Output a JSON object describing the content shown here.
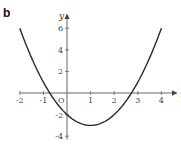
{
  "panel_label": "b",
  "chart_data": {
    "type": "line",
    "title": "",
    "function": "y = x^2 - 2x - 2",
    "xlabel": "x",
    "ylabel": "y",
    "origin_label": "O",
    "xlim": [
      -2,
      4.3
    ],
    "ylim": [
      -4.3,
      6.7
    ],
    "x_ticks": [
      -2,
      -1,
      1,
      2,
      3,
      4
    ],
    "x_tick_labels": [
      "-2",
      "-1",
      "1",
      "2",
      "3",
      "4"
    ],
    "y_ticks": [
      -4,
      -2,
      2,
      4,
      6
    ],
    "y_tick_labels": [
      "-4",
      "-2",
      "2",
      "4",
      "6"
    ],
    "grid": false,
    "legend": null,
    "series": [
      {
        "name": "parabola",
        "x": [
          -2,
          -1.5,
          -1,
          -0.732,
          -0.5,
          0,
          0.5,
          1,
          1.5,
          2,
          2.5,
          2.732,
          3,
          3.5,
          4
        ],
        "y": [
          6,
          3.25,
          1,
          0,
          -0.75,
          -2,
          -2.75,
          -3,
          -2.75,
          -2,
          -0.75,
          0,
          1,
          3.25,
          6
        ]
      }
    ],
    "key_points": {
      "vertex": [
        1,
        -3
      ],
      "y_intercept": [
        0,
        -2
      ],
      "x_intercepts": [
        -0.732,
        2.732
      ]
    },
    "colors": {
      "curve": "#2a2a2a",
      "axes": "#555555"
    }
  }
}
